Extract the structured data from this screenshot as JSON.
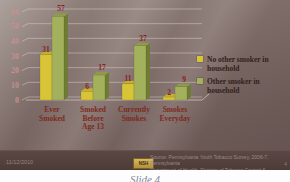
{
  "slide": {
    "legend": {
      "items": [
        {
          "label": "No other smoker in household",
          "color": "#d7c437"
        },
        {
          "label": "Other smoker in household",
          "color": "#a3b05c"
        }
      ]
    },
    "footer": {
      "date": "11/12/2010",
      "badge": "NSH",
      "source_line1": "Source: Pennsylvania Youth Tobacco Survey, 2006-7, Pennsylvania",
      "source_line2": "Department of Health, Division of Tobacco Control & Prevention",
      "page_number": "4"
    },
    "caption": "Slide 4"
  },
  "chart_data": {
    "type": "bar",
    "title": "",
    "xlabel": "",
    "ylabel": "",
    "categories": [
      "Ever Smoked",
      "Smoked Before Age 13",
      "Currently Smokes",
      "Smokes Everyday"
    ],
    "categories_lines": [
      [
        "Ever",
        "Smoked"
      ],
      [
        "Smoked",
        "Before",
        "Age 13"
      ],
      [
        "Currently",
        "Smokes"
      ],
      [
        "Smokes",
        "Everyday"
      ]
    ],
    "series": [
      {
        "name": "No other smoker in household",
        "values": [
          31,
          6,
          11,
          2
        ],
        "color": "#d7c437",
        "side_color": "#a08f1e",
        "top_color": "#c2b12e"
      },
      {
        "name": "Other smoker in household",
        "values": [
          57,
          17,
          37,
          9
        ],
        "color": "#a3b05c",
        "side_color": "#6f7c34",
        "top_color": "#8e9c4a"
      }
    ],
    "ylim": [
      0,
      60
    ],
    "yticks": [
      0,
      10,
      20,
      30,
      40,
      50,
      60
    ],
    "grid": true,
    "legend_position": "right",
    "value_label_color": "#8b1f1f",
    "tick_color": "#c5908d",
    "category_color": "#7e2a22",
    "gridline_color": "#d8ccc6",
    "axis_color": "#cfc2bb"
  }
}
